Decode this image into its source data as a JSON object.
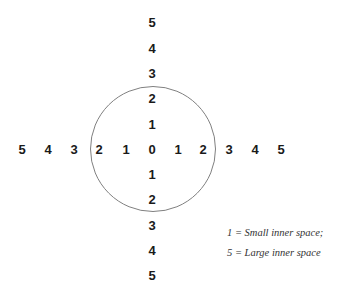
{
  "diagram": {
    "vertical_labels": [
      {
        "text": "5",
        "x": 152,
        "y": 22
      },
      {
        "text": "4",
        "x": 152,
        "y": 48
      },
      {
        "text": "3",
        "x": 152,
        "y": 73
      },
      {
        "text": "2",
        "x": 152,
        "y": 98
      },
      {
        "text": "1",
        "x": 152,
        "y": 124
      },
      {
        "text": "1",
        "x": 152,
        "y": 174
      },
      {
        "text": "2",
        "x": 152,
        "y": 199
      },
      {
        "text": "3",
        "x": 152,
        "y": 225
      },
      {
        "text": "4",
        "x": 152,
        "y": 250
      },
      {
        "text": "5",
        "x": 152,
        "y": 275
      }
    ],
    "horizontal_labels": [
      {
        "text": "5",
        "x": 22,
        "y": 149
      },
      {
        "text": "4",
        "x": 48,
        "y": 149
      },
      {
        "text": "3",
        "x": 74,
        "y": 149
      },
      {
        "text": "2",
        "x": 99,
        "y": 149
      },
      {
        "text": "1",
        "x": 126,
        "y": 149
      },
      {
        "text": "0",
        "x": 152,
        "y": 149
      },
      {
        "text": "1",
        "x": 178,
        "y": 149
      },
      {
        "text": "2",
        "x": 203,
        "y": 149
      },
      {
        "text": "3",
        "x": 229,
        "y": 149
      },
      {
        "text": "4",
        "x": 255,
        "y": 149
      },
      {
        "text": "5",
        "x": 281,
        "y": 149
      }
    ],
    "circle": {
      "cx": 152,
      "cy": 148,
      "r": 62,
      "color": "#808080"
    },
    "legend": {
      "line1": "1 = Small inner space;",
      "line2": "5 = Large inner space"
    }
  }
}
